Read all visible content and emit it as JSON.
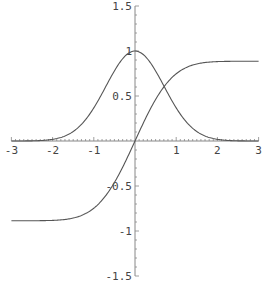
{
  "chart_data": {
    "type": "line",
    "title": "",
    "xlabel": "",
    "ylabel": "",
    "xlim": [
      -3,
      3
    ],
    "ylim": [
      -1.5,
      1.5
    ],
    "grid": false,
    "legend": null,
    "x_ticks": [
      "-3",
      "-2",
      "-1",
      "1",
      "2",
      "3"
    ],
    "y_ticks": [
      "1.5",
      "1",
      "0.5",
      "-0.5",
      "-1",
      "-1.5"
    ],
    "series": [
      {
        "name": "exp(-x^2)",
        "x": [
          -3,
          -2.5,
          -2,
          -1.5,
          -1,
          -0.5,
          0,
          0.5,
          1,
          1.5,
          2,
          2.5,
          3
        ],
        "y": [
          0.0001,
          0.0019,
          0.0183,
          0.1054,
          0.3679,
          0.7788,
          1.0,
          0.7788,
          0.3679,
          0.1054,
          0.0183,
          0.0019,
          0.0001
        ]
      },
      {
        "name": "integral of exp(-t^2) from 0 to x",
        "x": [
          -3,
          -2.5,
          -2,
          -1.5,
          -1,
          -0.5,
          0,
          0.5,
          1,
          1.5,
          2,
          2.5,
          3
        ],
        "y": [
          -0.8862,
          -0.8856,
          -0.8821,
          -0.8561,
          -0.7468,
          -0.4613,
          0,
          0.4613,
          0.7468,
          0.8561,
          0.8821,
          0.8856,
          0.8862
        ]
      }
    ],
    "colors": {
      "curve": "#555555",
      "axis": "#888888",
      "text": "#444444"
    }
  }
}
